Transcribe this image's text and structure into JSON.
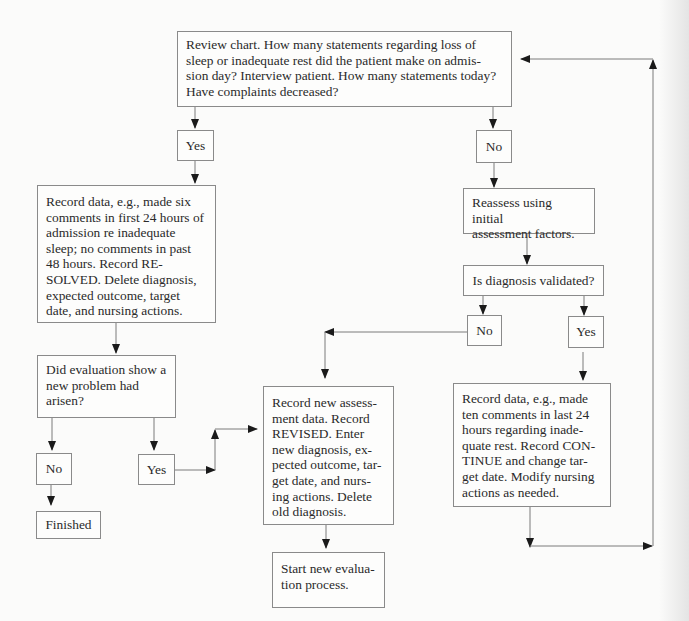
{
  "diagram": {
    "type": "flowchart",
    "nodes": {
      "review": {
        "lines": [
          "Review chart. How many statements regarding loss of",
          "sleep or inadequate rest did the patient make on admis-",
          "sion day? Interview patient. How many statements today?",
          "Have complaints decreased?"
        ]
      },
      "yes1": {
        "label": "Yes"
      },
      "no1": {
        "label": "No"
      },
      "resolved": {
        "lines": [
          "Record data, e.g., made six",
          "comments in first 24 hours of",
          "admission re inadequate",
          "sleep; no comments in past",
          "48 hours. Record RE-",
          "SOLVED. Delete diagnosis,",
          "expected outcome, target",
          "date, and nursing actions."
        ]
      },
      "reassess": {
        "lines": [
          "Reassess using initial",
          "assessment factors."
        ]
      },
      "validated": {
        "label": "Is diagnosis validated?"
      },
      "no2": {
        "label": "No"
      },
      "yes2": {
        "label": "Yes"
      },
      "new_problem": {
        "lines": [
          "Did evaluation show a",
          "new problem had",
          "arisen?"
        ]
      },
      "no3": {
        "label": "No"
      },
      "yes3": {
        "label": "Yes"
      },
      "finished": {
        "label": "Finished"
      },
      "revised": {
        "lines": [
          "Record new assess-",
          "ment data. Record",
          "REVISED. Enter",
          "new diagnosis, ex-",
          "pected outcome, tar-",
          "get date, and nurs-",
          "ing actions. Delete",
          "old diagnosis."
        ]
      },
      "continue": {
        "lines": [
          "Record data, e.g., made",
          "ten comments in last 24",
          "hours regarding inade-",
          "quate rest. Record CON-",
          "TINUE and change tar-",
          "get date. Modify nursing",
          "actions as needed."
        ]
      },
      "start_new": {
        "lines": [
          "Start new evalua-",
          "tion process."
        ]
      }
    },
    "edges": [
      [
        "review",
        "yes1"
      ],
      [
        "review",
        "no1"
      ],
      [
        "yes1",
        "resolved"
      ],
      [
        "no1",
        "reassess"
      ],
      [
        "reassess",
        "validated"
      ],
      [
        "validated",
        "no2"
      ],
      [
        "validated",
        "yes2"
      ],
      [
        "resolved",
        "new_problem"
      ],
      [
        "new_problem",
        "no3"
      ],
      [
        "new_problem",
        "yes3"
      ],
      [
        "no3",
        "finished"
      ],
      [
        "yes3",
        "revised"
      ],
      [
        "no2",
        "revised"
      ],
      [
        "revised",
        "start_new"
      ],
      [
        "yes2",
        "continue"
      ],
      [
        "continue",
        "review"
      ]
    ]
  }
}
